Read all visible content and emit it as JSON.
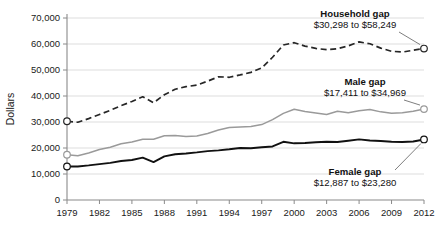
{
  "chart_data": {
    "type": "line",
    "title": "",
    "xlabel": "",
    "ylabel": "Dollars",
    "xlim": [
      1979,
      2012
    ],
    "ylim": [
      0,
      70000
    ],
    "ytick_values": [
      0,
      10000,
      20000,
      30000,
      40000,
      50000,
      60000,
      70000
    ],
    "ytick_labels": [
      "0",
      "10,000",
      "20,000",
      "30,000",
      "40,000",
      "50,000",
      "60,000",
      "70,000"
    ],
    "xtick_values": [
      1979,
      1982,
      1985,
      1988,
      1991,
      1994,
      1997,
      2000,
      2003,
      2006,
      2009,
      2012
    ],
    "xtick_labels": [
      "1979",
      "1982",
      "1985",
      "1988",
      "1991",
      "1994",
      "1997",
      "2000",
      "2003",
      "2006",
      "2009",
      "2012"
    ],
    "grid": "horizontal",
    "legend": "inline-annotations",
    "x": [
      1979,
      1980,
      1981,
      1982,
      1983,
      1984,
      1985,
      1986,
      1987,
      1988,
      1989,
      1990,
      1991,
      1992,
      1993,
      1994,
      1995,
      1996,
      1997,
      1998,
      1999,
      2000,
      2001,
      2002,
      2003,
      2004,
      2005,
      2006,
      2007,
      2008,
      2009,
      2010,
      2011,
      2012
    ],
    "series": [
      {
        "name": "Household gap",
        "style": "dashed",
        "color": "#262626",
        "start_value": 30298,
        "end_value": 58249,
        "values": [
          30298,
          29900,
          31300,
          32900,
          34500,
          36300,
          37900,
          39700,
          37400,
          40500,
          42600,
          43600,
          44200,
          45700,
          47400,
          47200,
          48100,
          49100,
          50800,
          54900,
          59600,
          60500,
          59200,
          58300,
          57800,
          58200,
          59300,
          60800,
          60100,
          58400,
          57200,
          56900,
          57600,
          58249
        ]
      },
      {
        "name": "Male gap",
        "style": "solid",
        "color": "#9a9a9a",
        "start_value": 17411,
        "end_value": 34969,
        "values": [
          17411,
          17000,
          18100,
          19400,
          20300,
          21600,
          22300,
          23400,
          23400,
          24700,
          24800,
          24400,
          24600,
          25600,
          26900,
          27900,
          28100,
          28300,
          29000,
          30900,
          33300,
          34900,
          34000,
          33500,
          32900,
          34100,
          33600,
          34300,
          34800,
          33900,
          33400,
          33600,
          34100,
          34969
        ]
      },
      {
        "name": "Female gap",
        "style": "solid",
        "color": "#111111",
        "start_value": 12887,
        "end_value": 23280,
        "values": [
          12887,
          12900,
          13300,
          13800,
          14300,
          15000,
          15400,
          16300,
          14600,
          16800,
          17600,
          17900,
          18300,
          18800,
          19100,
          19500,
          20000,
          19900,
          20300,
          20600,
          22400,
          21800,
          21900,
          22200,
          22400,
          22300,
          22800,
          23300,
          22900,
          22700,
          22400,
          22300,
          22500,
          23280
        ]
      }
    ],
    "annotations": [
      {
        "id": "household",
        "title": "Household gap",
        "value": "$30,298 to $58,249"
      },
      {
        "id": "male",
        "title": "Male gap",
        "value": "$17,411 to $34,969"
      },
      {
        "id": "female",
        "title": "Female gap",
        "value": "$12,887 to $23,280"
      }
    ]
  }
}
